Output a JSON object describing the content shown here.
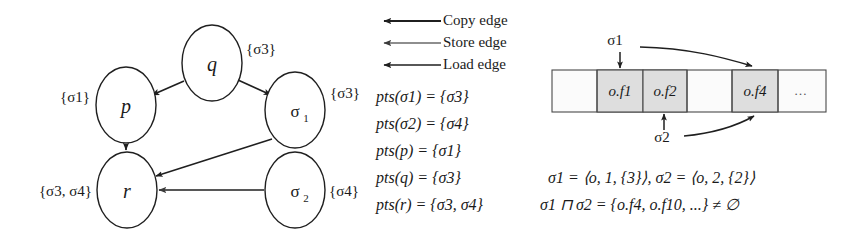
{
  "figure": {
    "background_color": "#ffffff",
    "ink_color": "#1f1f1f",
    "shade_color": "#dedede"
  },
  "graph": {
    "nodes": [
      {
        "id": "p",
        "label": "p",
        "sub": "",
        "set_label": "{σ1}",
        "set_side": "left",
        "cx": 126,
        "cy": 105,
        "rx": 30,
        "ry": 38
      },
      {
        "id": "q",
        "label": "q",
        "sub": "",
        "set_label": "{σ3}",
        "set_side": "right",
        "cx": 212,
        "cy": 63,
        "rx": 30,
        "ry": 38
      },
      {
        "id": "sigma1",
        "label": "σ",
        "sub": "1",
        "set_label": "{σ3}",
        "set_side": "right",
        "cx": 295,
        "cy": 110,
        "rx": 30,
        "ry": 38
      },
      {
        "id": "r",
        "label": "r",
        "sub": "",
        "set_label": "{σ3, σ4}",
        "set_side": "left",
        "cx": 127,
        "cy": 190,
        "rx": 30,
        "ry": 38
      },
      {
        "id": "sigma2",
        "label": "σ",
        "sub": "2",
        "set_label": "{σ4}",
        "set_side": "right",
        "cx": 295,
        "cy": 190,
        "rx": 30,
        "ry": 38
      }
    ],
    "edges": [
      {
        "id": "q-to-p",
        "from": "q",
        "to": "p",
        "kind": "copy"
      },
      {
        "id": "q-to-sigma1",
        "from": "q",
        "to": "sigma1",
        "kind": "copy"
      },
      {
        "id": "p-to-r",
        "from": "p",
        "to": "r",
        "kind": "copy"
      },
      {
        "id": "sigma1-to-r",
        "from": "sigma1",
        "to": "r",
        "kind": "load"
      },
      {
        "id": "sigma2-to-r",
        "from": "sigma2",
        "to": "r",
        "kind": "store"
      }
    ]
  },
  "legend": {
    "items": [
      {
        "id": "copy",
        "label": "Copy edge",
        "arrow": "left-arrow-icon",
        "weight": 2.0
      },
      {
        "id": "store",
        "label": "Store edge",
        "arrow": "left-arrow-icon",
        "weight": 1.1
      },
      {
        "id": "load",
        "label": "Load edge",
        "arrow": "left-arrow-icon",
        "weight": 1.6
      }
    ]
  },
  "equations": {
    "pts": [
      "pts(σ1) = {σ3}",
      "pts(σ2) = {σ4}",
      "pts(p) = {σ1}",
      "pts(q) = {σ3}",
      "pts(r) = {σ3, σ4}"
    ],
    "sigma_defs": "σ1 = ⟨o, 1, {3}⟩,  σ2 = ⟨o, 2, {2}⟩",
    "intersection": "σ1 ⊓ σ2 = {o.f4, o.f10, ...} ≠ ∅"
  },
  "memory": {
    "cells": [
      {
        "id": "cell-0",
        "label": "",
        "shaded": false
      },
      {
        "id": "cell-1",
        "label": "o.f1",
        "shaded": true
      },
      {
        "id": "cell-2",
        "label": "o.f2",
        "shaded": true
      },
      {
        "id": "cell-3",
        "label": "",
        "shaded": false
      },
      {
        "id": "cell-4",
        "label": "o.f4",
        "shaded": true
      },
      {
        "id": "cell-5",
        "label": "…",
        "shaded": false
      }
    ],
    "pointers": [
      {
        "id": "sigma1-pointer",
        "label": "σ1",
        "targets": [
          "cell-1",
          "cell-4"
        ]
      },
      {
        "id": "sigma2-pointer",
        "label": "σ2",
        "targets": [
          "cell-2",
          "cell-4"
        ]
      }
    ]
  }
}
